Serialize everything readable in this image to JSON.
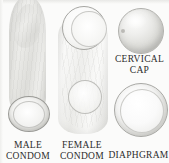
{
  "figure": {
    "background_color": "#fbfbfa",
    "text_color": "#2b2b2b"
  },
  "items": [
    {
      "id": "male-condom",
      "icon": "male-condom-illustration",
      "caption_line1": "MALE",
      "caption_line2": "CONDOM"
    },
    {
      "id": "female-condom",
      "icon": "female-condom-illustration",
      "caption_line1": "FEMALE",
      "caption_line2": "CONDOM"
    },
    {
      "id": "cervical-cap",
      "icon": "cervical-cap-illustration",
      "caption_line1": "CERVICAL",
      "caption_line2": "CAP"
    },
    {
      "id": "diaphragm",
      "icon": "diaphragm-illustration",
      "caption_line1": "DIAPHGRAM",
      "caption_line2": ""
    }
  ]
}
